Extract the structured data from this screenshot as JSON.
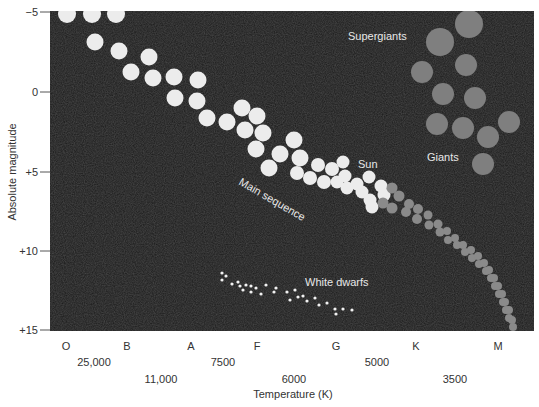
{
  "chart_data": {
    "type": "scatter",
    "title": "",
    "xlabel": "Temperature (K)",
    "ylabel": "Absolute magnitude",
    "ylim": [
      -5,
      15
    ],
    "y_inverted": true,
    "grid": false,
    "legend": "none",
    "background": "#1a1a1a",
    "yticks": [
      {
        "label": "−5",
        "value": -5,
        "py": 12
      },
      {
        "label": "0",
        "value": 0,
        "py": 92
      },
      {
        "label": "+5",
        "value": 5,
        "py": 172
      },
      {
        "label": "+10",
        "value": 10,
        "py": 251
      },
      {
        "label": "+15",
        "value": 15,
        "py": 330
      }
    ],
    "spectral_classes": [
      {
        "label": "O",
        "px": 66
      },
      {
        "label": "B",
        "px": 127
      },
      {
        "label": "A",
        "px": 191
      },
      {
        "label": "F",
        "px": 257
      },
      {
        "label": "G",
        "px": 336
      },
      {
        "label": "K",
        "px": 416
      },
      {
        "label": "M",
        "px": 498
      }
    ],
    "temperature_ticks_row1": [
      {
        "label": "25,000",
        "px": 94
      },
      {
        "label": "7500",
        "px": 223
      },
      {
        "label": "5000",
        "px": 377
      }
    ],
    "temperature_ticks_row2": [
      {
        "label": "11,000",
        "px": 161
      },
      {
        "label": "6000",
        "px": 294
      },
      {
        "label": "3500",
        "px": 455
      }
    ],
    "annotations": [
      {
        "text": "Supergiants",
        "x": 348,
        "y": 40,
        "rotate": 0
      },
      {
        "text": "Giants",
        "x": 427,
        "y": 161,
        "rotate": 0
      },
      {
        "text": "Sun",
        "x": 358,
        "y": 168,
        "rotate": 0
      },
      {
        "text": "Main sequence",
        "x": 238,
        "y": 184,
        "rotate": 30
      },
      {
        "text": "White dwarfs",
        "x": 305,
        "y": 286,
        "rotate": 0
      }
    ],
    "series": [
      {
        "name": "Main sequence (bright)",
        "color": "#ececec",
        "points": [
          [
            67,
            14,
            9
          ],
          [
            92,
            14,
            9
          ],
          [
            116,
            14,
            9
          ],
          [
            95,
            42,
            8.5
          ],
          [
            119,
            51,
            8.5
          ],
          [
            149,
            57,
            8.5
          ],
          [
            131,
            72,
            8.5
          ],
          [
            153,
            78,
            8.5
          ],
          [
            174,
            77,
            8.5
          ],
          [
            198,
            80,
            8.5
          ],
          [
            175,
            98,
            8.5
          ],
          [
            197,
            101,
            8.5
          ],
          [
            207,
            118,
            8.5
          ],
          [
            227,
            122,
            8.5
          ],
          [
            242,
            108,
            8.5
          ],
          [
            257,
            116,
            8.5
          ],
          [
            245,
            130,
            8.5
          ],
          [
            263,
            133,
            8.5
          ],
          [
            256,
            149,
            8.5
          ],
          [
            280,
            154,
            8.5
          ],
          [
            294,
            140,
            8.5
          ],
          [
            300,
            158,
            8.5
          ],
          [
            269,
            168,
            8.5
          ],
          [
            297,
            173,
            7
          ],
          [
            318,
            165,
            7
          ],
          [
            310,
            178,
            7
          ],
          [
            332,
            169,
            7
          ],
          [
            324,
            182,
            7
          ],
          [
            343,
            162,
            6.5
          ],
          [
            345,
            176,
            6.5
          ],
          [
            337,
            182,
            6.5
          ],
          [
            347,
            188,
            6.5
          ],
          [
            357,
            184,
            6.5
          ],
          [
            369,
            177,
            6.5
          ],
          [
            362,
            192,
            6.5
          ],
          [
            381,
            186,
            6.5
          ],
          [
            370,
            200,
            6.5
          ],
          [
            372,
            207,
            6.5
          ],
          [
            384,
            195,
            6.5
          ]
        ]
      },
      {
        "name": "Main sequence (dim red dwarfs)",
        "color": "#8a8a8a",
        "points": [
          [
            392,
            188,
            5.5
          ],
          [
            399,
            196,
            5.5
          ],
          [
            392,
            208,
            5.5
          ],
          [
            383,
            203,
            5.5
          ],
          [
            409,
            204,
            5
          ],
          [
            406,
            212,
            5
          ],
          [
            418,
            209,
            5
          ],
          [
            417,
            219,
            5
          ],
          [
            428,
            215,
            4.5
          ],
          [
            429,
            225,
            4.5
          ],
          [
            438,
            224,
            4.5
          ],
          [
            440,
            232,
            4.5
          ],
          [
            447,
            231,
            4
          ],
          [
            448,
            240,
            4
          ],
          [
            455,
            238,
            4
          ],
          [
            457,
            245,
            4
          ],
          [
            463,
            245,
            4
          ],
          [
            465,
            252,
            4
          ],
          [
            471,
            250,
            4
          ],
          [
            472,
            258,
            4
          ],
          [
            478,
            256,
            4
          ],
          [
            479,
            264,
            4
          ],
          [
            484,
            263,
            4
          ],
          [
            486,
            271,
            4
          ],
          [
            489,
            270,
            4
          ],
          [
            491,
            278,
            4
          ],
          [
            494,
            278,
            4
          ],
          [
            495,
            286,
            4
          ],
          [
            498,
            286,
            4
          ],
          [
            499,
            294,
            4
          ],
          [
            502,
            294,
            4
          ],
          [
            503,
            302,
            4
          ],
          [
            505,
            302,
            4
          ],
          [
            506,
            310,
            4
          ],
          [
            509,
            310,
            4
          ],
          [
            509,
            318,
            4
          ],
          [
            512,
            320,
            4
          ],
          [
            513,
            327,
            4
          ]
        ]
      },
      {
        "name": "Giants and supergiants",
        "color": "#7f7f7f",
        "points": [
          [
            469,
            24,
            14
          ],
          [
            440,
            42,
            14
          ],
          [
            466,
            65,
            11
          ],
          [
            422,
            72,
            11
          ],
          [
            443,
            94,
            11
          ],
          [
            475,
            98,
            11
          ],
          [
            437,
            124,
            11
          ],
          [
            463,
            128,
            11
          ],
          [
            509,
            122,
            11
          ],
          [
            488,
            137,
            11
          ],
          [
            483,
            164,
            11
          ]
        ]
      },
      {
        "name": "White dwarfs",
        "color": "#f2f2f2",
        "points": [
          [
            222,
            273,
            1.6
          ],
          [
            226,
            276,
            1.6
          ],
          [
            222,
            280,
            1.6
          ],
          [
            232,
            284,
            1.6
          ],
          [
            238,
            282,
            1.6
          ],
          [
            240,
            286,
            1.6
          ],
          [
            246,
            285,
            1.6
          ],
          [
            243,
            290,
            1.6
          ],
          [
            251,
            286,
            1.6
          ],
          [
            251,
            292,
            1.6
          ],
          [
            256,
            288,
            1.6
          ],
          [
            261,
            294,
            1.6
          ],
          [
            266,
            285,
            1.6
          ],
          [
            274,
            292,
            1.6
          ],
          [
            276,
            288,
            1.6
          ],
          [
            287,
            292,
            1.6
          ],
          [
            295,
            290,
            1.6
          ],
          [
            290,
            300,
            1.6
          ],
          [
            298,
            297,
            1.6
          ],
          [
            303,
            296,
            1.6
          ],
          [
            307,
            301,
            1.6
          ],
          [
            315,
            298,
            1.6
          ],
          [
            319,
            305,
            1.6
          ],
          [
            327,
            303,
            1.6
          ],
          [
            335,
            309,
            1.6
          ],
          [
            336,
            314,
            1.6
          ],
          [
            343,
            309,
            1.6
          ],
          [
            352,
            310,
            1.6
          ]
        ]
      }
    ]
  }
}
